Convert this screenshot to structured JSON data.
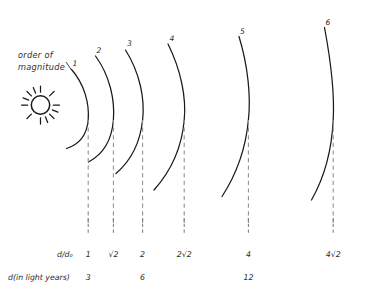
{
  "figure": {
    "annotation": {
      "order_of_magnitude_line1": "order  of",
      "order_of_magnitude_line2": "magnitude"
    },
    "sun": {
      "icon": "sun-icon",
      "rays": 12
    },
    "wavefronts": [
      {
        "label": "1",
        "apex_x": 88,
        "apex_y": 120
      },
      {
        "label": "2",
        "apex_x": 113,
        "apex_y": 120
      },
      {
        "label": "3",
        "apex_x": 142,
        "apex_y": 120
      },
      {
        "label": "4",
        "apex_x": 184,
        "apex_y": 120
      },
      {
        "label": "5",
        "apex_x": 248,
        "apex_y": 120
      },
      {
        "label": "6",
        "apex_x": 333,
        "apex_y": 120
      }
    ],
    "axis": {
      "row1_header": "d/d₀",
      "row1_values": [
        "1",
        "√2",
        "2",
        "2√2",
        "4",
        "4√2"
      ],
      "row2_header": "d(in light  years)",
      "row2_values": [
        "3",
        "",
        "6",
        "",
        "12",
        ""
      ]
    },
    "colors": {
      "ink": "#1a1a1a",
      "dash": "#8d8d8d",
      "paper": "#ffffff"
    }
  }
}
